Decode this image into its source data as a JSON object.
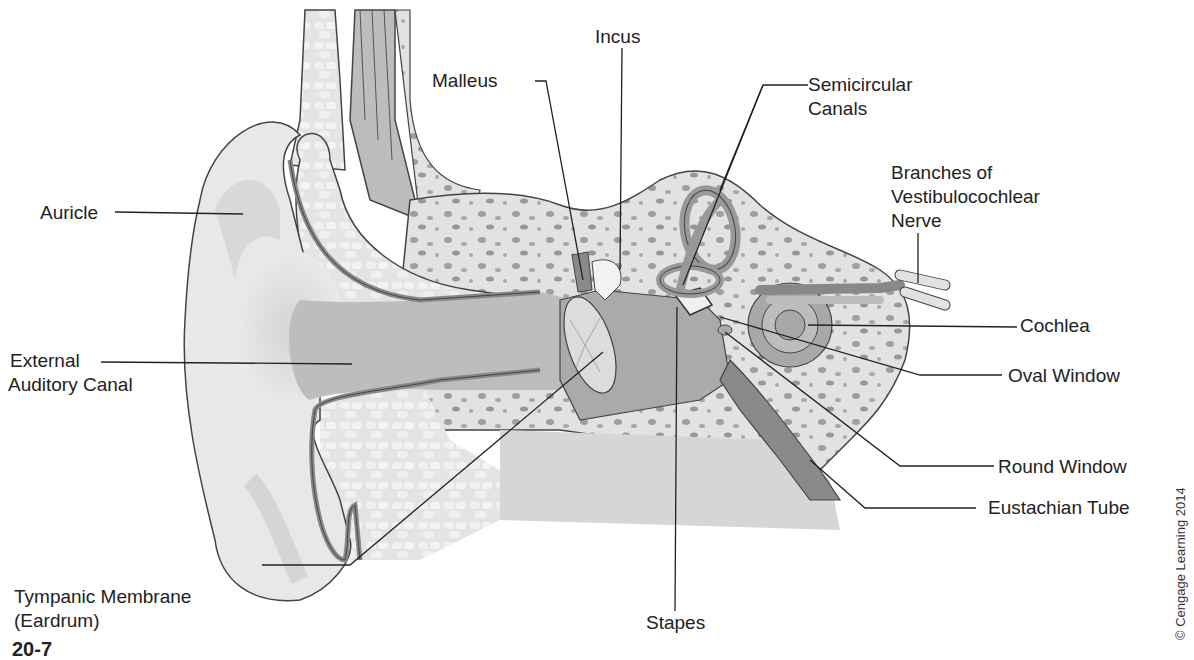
{
  "diagram": {
    "figure_number_partial": "20-7",
    "credit": "© Cengage Learning 2014",
    "colors": {
      "skin": "#e6e6e6",
      "skin_shadow": "#c4c4c4",
      "canal": "#b5b5b5",
      "cartilage": "#ededed",
      "bone": "#dadada",
      "bone_spots": "#9a9a9a",
      "dark_structure": "#8a8a8a",
      "outline": "#444444",
      "leader_line": "#222222"
    },
    "labels": {
      "auricle": "Auricle",
      "external_auditory_canal_1": "External",
      "external_auditory_canal_2": "Auditory Canal",
      "tympanic_membrane_1": "Tympanic Membrane",
      "tympanic_membrane_2": "(Eardrum)",
      "malleus": "Malleus",
      "incus": "Incus",
      "stapes": "Stapes",
      "semicircular_canals_1": "Semicircular",
      "semicircular_canals_2": "Canals",
      "nerve_1": "Branches of",
      "nerve_2": "Vestibulocochlear",
      "nerve_3": "Nerve",
      "cochlea": "Cochlea",
      "oval_window": "Oval Window",
      "round_window": "Round Window",
      "eustachian_tube": "Eustachian Tube"
    }
  }
}
